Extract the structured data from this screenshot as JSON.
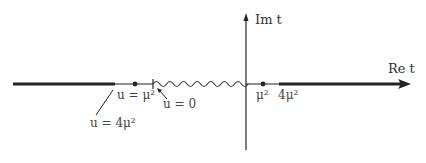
{
  "diagram": {
    "axes": {
      "real_label": "Re t",
      "imag_label": "Im t"
    },
    "left_labels": {
      "u_mu2": "u = μ²",
      "u_0": "u = 0",
      "u_4mu2": "u = 4μ²"
    },
    "right_labels": {
      "mu2": "μ²",
      "four_mu2": "4μ²"
    },
    "colors": {
      "ink": "#222222",
      "background": "#ffffff"
    }
  }
}
